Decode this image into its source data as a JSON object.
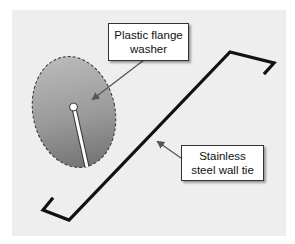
{
  "diagram": {
    "type": "labeled-illustration",
    "background_color": "#eeeeee",
    "components": [
      {
        "id": "washer",
        "label_lines": [
          "Plastic flange",
          "washer"
        ],
        "shape": "dashed-outline ellipse with gray gradient",
        "color": "#8a8a8a"
      },
      {
        "id": "wall-tie",
        "label_lines": [
          "Stainless",
          "steel wall tie"
        ],
        "shape": "Z-shaped bent black wire",
        "color": "#111111"
      }
    ]
  },
  "labels": {
    "washer": {
      "line1": "Plastic flange",
      "line2": "washer"
    },
    "tie": {
      "line1": "Stainless",
      "line2": "steel wall tie"
    }
  }
}
